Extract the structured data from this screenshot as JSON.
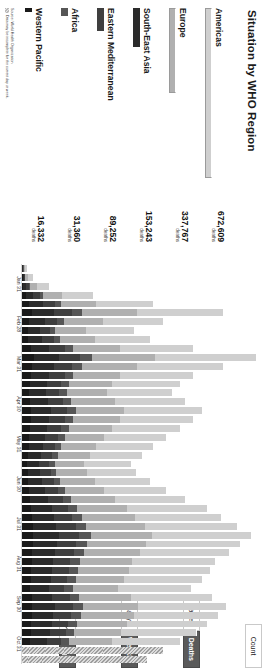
{
  "region_panel": {
    "title": "Situation by WHO Region",
    "unit_label": "deaths",
    "source_lines": [
      "Source: World Health Organization",
      "Data may be incomplete for the current day or week."
    ]
  },
  "toolbar": {
    "count_label": "Count",
    "metric": {
      "options": [
        "Cases",
        "Deaths"
      ],
      "selected": "Deaths"
    },
    "interval": {
      "options": [
        "Daily",
        "Weekly"
      ],
      "selected": "Weekly"
    },
    "chart_type": {
      "options": [
        "line-chart-icon",
        "bar-chart-icon"
      ],
      "selected": "bar-chart-icon"
    }
  },
  "chart_data": [
    {
      "type": "bar",
      "title": "Situation by WHO Region",
      "orientation": "horizontal",
      "xlabel": "",
      "ylabel": "",
      "categories": [
        "Americas",
        "Europe",
        "South-East Asia",
        "Eastern Mediterranean",
        "Africa",
        "Western Pacific"
      ],
      "values": [
        672609,
        337767,
        153243,
        89252,
        31360,
        16332
      ],
      "value_labels": [
        "672,609",
        "337,767",
        "153,243",
        "89,252",
        "31,360",
        "16,332"
      ],
      "value_sublabel": "deaths",
      "xlim": [
        0,
        672609
      ],
      "grid": false,
      "legend": "none"
    },
    {
      "type": "bar",
      "subtype": "stacked",
      "title": "",
      "xlabel": "",
      "ylabel": "",
      "x": [
        "Jan 31",
        "Feb 28",
        "Mar 31",
        "Apr 30",
        "May 31",
        "Jun 30",
        "Jul 31",
        "Aug 31",
        "Sep 30",
        "Oct 31"
      ],
      "tick_labels": [
        "Jan 31",
        "Feb 28",
        "Mar 31",
        "Apr 30",
        "May 31",
        "Jun 30",
        "Jul 31",
        "Aug 31",
        "Sep 30",
        "Oct 31"
      ],
      "series": [
        {
          "name": "Western Pacific",
          "color": "#1a1a1a"
        },
        {
          "name": "South-East Asia",
          "color": "#2b2b2b"
        },
        {
          "name": "Eastern Mediterranean",
          "color": "#3f3f3f"
        },
        {
          "name": "Africa",
          "color": "#565656"
        },
        {
          "name": "Europe",
          "color": "#b0b0b0"
        },
        {
          "name": "Americas",
          "color": "#cfcfcf"
        }
      ],
      "weekly_totals": [
        2,
        4,
        10,
        26,
        48,
        74,
        52,
        41,
        47,
        63,
        86,
        74,
        63,
        58,
        55,
        60,
        66,
        63,
        58,
        53,
        48,
        44,
        40,
        42,
        47,
        53,
        60,
        68,
        73,
        79,
        84,
        80,
        76,
        71,
        69,
        66,
        62,
        70,
        75,
        72,
        68,
        64,
        58,
        52,
        46
      ],
      "grid": false,
      "legend": "none",
      "note": "weekly stacked deaths by WHO region"
    }
  ]
}
